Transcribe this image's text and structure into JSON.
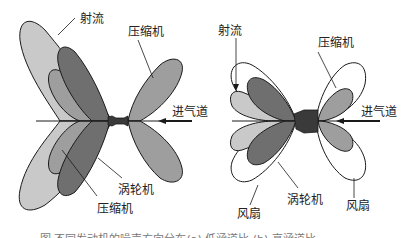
{
  "figure": {
    "left_diagram": {
      "labels": {
        "jet": "射流",
        "compressor_top": "压缩机",
        "inlet": "进气道",
        "turbine": "涡轮机",
        "compressor_bottom": "压缩机"
      }
    },
    "right_diagram": {
      "labels": {
        "jet": "射流",
        "compressor": "压缩机",
        "inlet": "进气道",
        "turbine": "涡轮机",
        "fan_left": "风扇",
        "fan_right": "风扇"
      }
    },
    "caption": "图 不同发动机的噪声方向分布(a) 低涵道比 (b) 高涵道比",
    "colors": {
      "jet": "#c9c9c9",
      "compressor": "#9e9e9e",
      "turbine": "#6f6f6f",
      "engine": "#3a3a3a",
      "fan": "#ffffff",
      "outline": "#1a1a1a"
    }
  }
}
